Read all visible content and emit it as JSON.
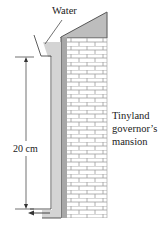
{
  "diagram": {
    "labels": {
      "water": "Water",
      "height": "20 cm",
      "building_line1": "Tinyland",
      "building_line2": "governor’s",
      "building_line3": "mansion"
    },
    "colors": {
      "pipe_fill": "#d4d4d4",
      "roof_fill": "#bdbdbd",
      "wall_shade": "#a8a8a8",
      "brick_lines": "#9a9a9a",
      "line": "#333333"
    },
    "elements": [
      "funnel",
      "vertical-pipe",
      "outlet-arrow",
      "dimension-arrow",
      "brick-building",
      "roof"
    ]
  }
}
